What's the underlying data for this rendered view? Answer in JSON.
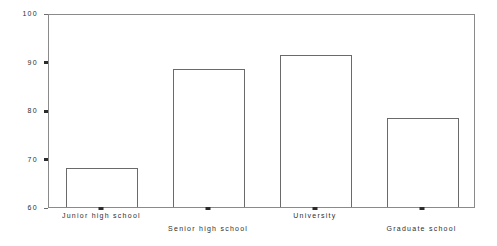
{
  "chart_data": {
    "type": "bar",
    "title": "",
    "subtitle": "",
    "xlabel": "",
    "ylabel": "",
    "categories": [
      "Junior high school",
      "Senior high school",
      "University",
      "Graduate school"
    ],
    "values": [
      68.0,
      88.5,
      91.3,
      78.4
    ],
    "series": [
      {
        "name": "",
        "values": [
          68.0,
          88.5,
          91.3,
          78.4
        ]
      }
    ],
    "ylim": [
      60,
      100
    ],
    "yticks": [
      60,
      70,
      80,
      90,
      100
    ],
    "ytick_labels": [
      "60",
      "70",
      "80",
      "90",
      "100"
    ],
    "grid": false,
    "legend": null,
    "legend_position": "none",
    "annotations": [],
    "bar_face_color": "#ffffff",
    "bar_edge_color": "#6a6a6a",
    "axis_color": "#8a8a8a",
    "background_color": "#ffffff",
    "label_stagger": [
      "top",
      "bottom",
      "top",
      "bottom"
    ]
  },
  "axis": {
    "y_ticks": [
      {
        "label": "100",
        "value": 100
      },
      {
        "label": "90",
        "value": 90
      },
      {
        "label": "80",
        "value": 80
      },
      {
        "label": "70",
        "value": 70
      },
      {
        "label": "60",
        "value": 60
      }
    ],
    "x_ticks": [
      {
        "label": "Junior high school",
        "row": "top"
      },
      {
        "label": "Senior high school",
        "row": "bottom"
      },
      {
        "label": "University",
        "row": "top"
      },
      {
        "label": "Graduate school",
        "row": "bottom"
      }
    ]
  }
}
